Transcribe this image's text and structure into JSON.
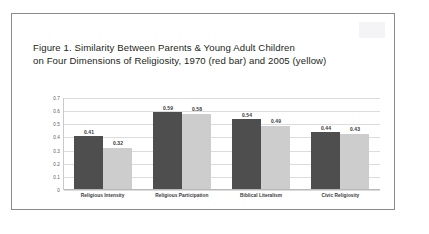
{
  "figure": {
    "title": "Figure 1. Similarity Between Parents & Young Adult Children\non Four Dimensions of Religiosity, 1970 (red bar) and 2005 (yellow)",
    "watermark": ""
  },
  "chart_data": {
    "type": "bar",
    "title": "Figure 1. Similarity Between Parents & Young Adult Children on Four Dimensions of Religiosity, 1970 (red bar) and 2005 (yellow)",
    "categories": [
      "Religious Intensity",
      "Religious Participation",
      "Biblical Literalism",
      "Civic Religiosity"
    ],
    "series": [
      {
        "name": "1970 (red bar)",
        "color": "#4e4e4e",
        "values": [
          0.41,
          0.59,
          0.54,
          0.44
        ],
        "labels": [
          "0.41",
          "0.59",
          "0.54",
          "0.44"
        ]
      },
      {
        "name": "2005 (yellow)",
        "color": "#cdcdcd",
        "values": [
          0.32,
          0.58,
          0.49,
          0.43
        ],
        "labels": [
          "0.32",
          "0.58",
          "0.49",
          "0.43"
        ]
      }
    ],
    "xlabel": "",
    "ylabel": "",
    "ylim": [
      0,
      0.7
    ],
    "yticks": [
      0.7,
      0.6,
      0.5,
      0.4,
      0.3,
      0.2,
      0.1,
      0
    ],
    "ytick_labels": [
      "0.7",
      "0.6",
      "0.5",
      "0.4",
      "0.3",
      "0.2",
      "0.1",
      "0"
    ],
    "grid": true,
    "legend": false
  }
}
